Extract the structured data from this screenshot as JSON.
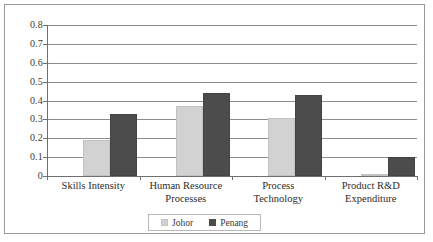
{
  "chart_data": {
    "type": "bar",
    "title": "",
    "xlabel": "",
    "ylabel": "",
    "ylim": [
      0,
      0.8
    ],
    "grid": true,
    "legend_position": "bottom",
    "categories": [
      "Skills Intensity",
      "Human Resource Processes",
      "Process Technology",
      "Product R&D Expenditure"
    ],
    "category_lines": [
      [
        "Skills Intensity"
      ],
      [
        "Human Resource",
        "Processes"
      ],
      [
        "Process",
        "Technology"
      ],
      [
        "Product R&D",
        "Expenditure"
      ]
    ],
    "y_ticks": [
      "0.8",
      "0.7",
      "0.6",
      "0.5",
      "0.4",
      "0.3",
      "0.2",
      "0.1",
      "0"
    ],
    "y_tick_values": [
      0.8,
      0.7,
      0.6,
      0.5,
      0.4,
      0.3,
      0.2,
      0.1,
      0
    ],
    "series": [
      {
        "name": "Johor",
        "color": "#d2d2d2",
        "values": [
          0.19,
          0.37,
          0.31,
          0.01
        ]
      },
      {
        "name": "Penang",
        "color": "#4c4c4c",
        "values": [
          0.33,
          0.44,
          0.43,
          0.1
        ]
      }
    ]
  },
  "legend": {
    "entries": [
      {
        "label": "Johor",
        "swatch": "johor-swatch-icon"
      },
      {
        "label": "Penang",
        "swatch": "penang-swatch-icon"
      }
    ]
  }
}
